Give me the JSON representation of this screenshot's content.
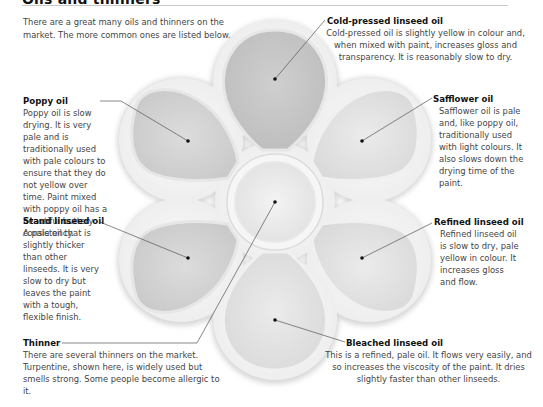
{
  "page": {
    "title": "Oils and thinners",
    "intro": "There are a great many oils and thinners on the market. The more common ones are listed below."
  },
  "items": [
    {
      "id": "cold-pressed",
      "title": "Cold-pressed linseed oil",
      "text": "Cold-pressed oil is slightly yellow in colour and, when mixed with paint, increases gloss and transparency. It is reasonably slow to dry."
    },
    {
      "id": "poppy",
      "title": "Poppy oil",
      "text": "Poppy oil is slow drying. It is very pale and is traditionally used with pale colours to ensure that they do not yellow over time. Paint mixed with poppy oil has a beautiful buttery consistency."
    },
    {
      "id": "safflower",
      "title": "Safflower oil",
      "text": "Safflower oil is pale and, like poppy oil, traditionally used with light colours. It also slows down the drying time of the paint."
    },
    {
      "id": "stand",
      "title": "Stand linseed oil",
      "text": "A pale oil that is slightly thicker than other linseeds. It is very slow to dry but leaves the paint with a tough, flexible finish."
    },
    {
      "id": "refined",
      "title": "Refined linseed oil",
      "text": "Refined linseed oil is slow to dry, pale yellow in colour. It increases gloss and flow."
    },
    {
      "id": "thinner",
      "title": "Thinner",
      "text": "There are several thinners on the market. Turpentine, shown here, is widely used but smells strong. Some people become allergic to it."
    },
    {
      "id": "bleached",
      "title": "Bleached linseed oil",
      "text": "This is a refined, pale oil. It flows very easily, and so increases the viscosity of the paint. It dries slightly faster than other linseeds."
    }
  ],
  "colors": {
    "palette_rim": "#f4f4f4",
    "well_dark": "#c8c8c8",
    "well_mid": "#dadada",
    "well_light": "#ececec",
    "leader": "#555555",
    "heading": "#111111",
    "body_text": "#444444"
  }
}
